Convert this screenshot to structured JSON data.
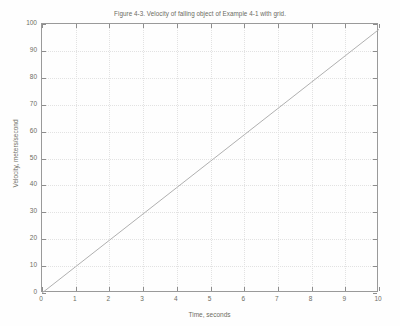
{
  "chart_data": {
    "type": "line",
    "title": "Figure 4-3. Velocity of falling object of Example 4-1 with grid.",
    "xlabel": "Time, seconds",
    "ylabel": "Velocity, meters/second",
    "xlim": [
      0,
      10
    ],
    "ylim": [
      0,
      100
    ],
    "xticks": [
      0,
      1,
      2,
      3,
      4,
      5,
      6,
      7,
      8,
      9,
      10
    ],
    "yticks": [
      0,
      10,
      20,
      30,
      40,
      50,
      60,
      70,
      80,
      90,
      100
    ],
    "xtick_labels": [
      "0",
      "1",
      "2",
      "3",
      "4",
      "5",
      "6",
      "7",
      "8",
      "9",
      "10"
    ],
    "ytick_labels": [
      "0",
      "10",
      "20",
      "30",
      "40",
      "50",
      "60",
      "70",
      "80",
      "90",
      "100"
    ],
    "grid": true,
    "legend": "none",
    "series": [
      {
        "name": "velocity",
        "color": "#b0b0b0",
        "x": [
          0,
          1,
          2,
          3,
          4,
          5,
          6,
          7,
          8,
          9,
          10
        ],
        "values": [
          0,
          9.8,
          19.6,
          29.4,
          39.2,
          49,
          58.8,
          68.6,
          78.4,
          88.2,
          98
        ]
      }
    ]
  },
  "style": {
    "axis_color": "#9a9a9a",
    "grid_color": "#e2e2e2",
    "text_color": "#6d6d63",
    "line_color": "#b0b0b0",
    "background": "#fefefe"
  }
}
